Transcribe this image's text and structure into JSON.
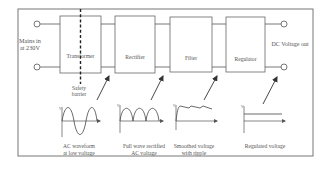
{
  "input": {
    "label_line1": "Mains in",
    "label_line2": "at 230V"
  },
  "output": {
    "label": "DC Voltage out"
  },
  "blocks": [
    {
      "id": "transformer",
      "label": "Transformer"
    },
    {
      "id": "rectifier",
      "label": "Rectifier"
    },
    {
      "id": "filter",
      "label": "Filter"
    },
    {
      "id": "regulator",
      "label": "Regulator"
    }
  ],
  "safety_barrier": {
    "line1": "Safety",
    "line2": "barrier"
  },
  "waveforms": [
    {
      "id": "ac",
      "caption_line1": "AC waveform",
      "caption_line2": "at low voltage",
      "axis_label": "V"
    },
    {
      "id": "rectified",
      "caption_line1": "Full wave rectified",
      "caption_line2": "AC voltage",
      "axis_label": "V"
    },
    {
      "id": "smoothed",
      "caption_line1": "Smoothed voltage",
      "caption_line2": "with ripple",
      "axis_label": "V"
    },
    {
      "id": "regulated",
      "caption_line1": "Regulated voltage",
      "caption_line2": "",
      "axis_label": "V"
    }
  ],
  "colors": {
    "line": "#555555",
    "frame": "#777777",
    "text": "#555555",
    "background": "#ffffff"
  }
}
